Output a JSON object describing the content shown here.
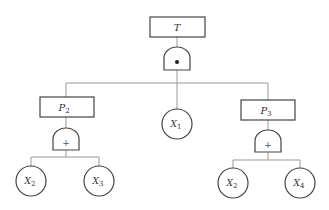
{
  "diagram": {
    "type": "fault-tree",
    "top_event": {
      "label": "T",
      "gate": "AND",
      "gate_symbol": "•"
    },
    "intermediate_events": [
      {
        "label": "P",
        "sub": "2",
        "gate": "OR",
        "gate_symbol": "+",
        "children": [
          {
            "label": "X",
            "sub": "2"
          },
          {
            "label": "X",
            "sub": "3"
          }
        ]
      },
      {
        "label": "P",
        "sub": "3",
        "gate": "OR",
        "gate_symbol": "+",
        "children": [
          {
            "label": "X",
            "sub": "2"
          },
          {
            "label": "X",
            "sub": "4"
          }
        ]
      }
    ],
    "basic_events": [
      {
        "label": "X",
        "sub": "1"
      }
    ],
    "colors": {
      "line": "#888888",
      "box": "#444444"
    }
  }
}
